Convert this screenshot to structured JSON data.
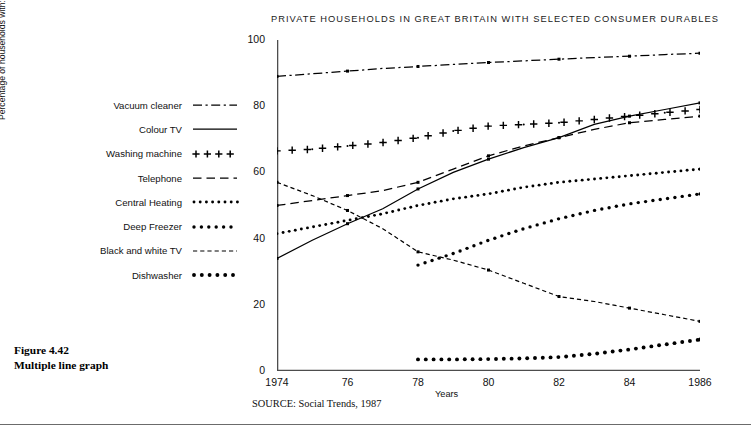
{
  "figure": {
    "caption_line1": "Figure 4.42",
    "caption_line2": "Multiple line graph",
    "source": "SOURCE: Social Trends, 1987"
  },
  "legend": {
    "items": [
      {
        "label": "Vacuum cleaner",
        "style": "dash-dot"
      },
      {
        "label": "Colour TV",
        "style": "solid"
      },
      {
        "label": "Washing machine",
        "style": "plus-markers"
      },
      {
        "label": "Telephone",
        "style": "long-dash"
      },
      {
        "label": "Central Heating",
        "style": "fine-dots"
      },
      {
        "label": "Deep Freezer",
        "style": "medium-dots"
      },
      {
        "label": "Black and white TV",
        "style": "short-dash"
      },
      {
        "label": "Dishwasher",
        "style": "bold-dots"
      }
    ]
  },
  "chart_data": {
    "type": "line",
    "title": "PRIVATE HOUSEHOLDS IN GREAT BRITAIN WITH SELECTED CONSUMER DURABLES",
    "xlabel": "Years",
    "ylabel": "Percentage of households with:",
    "xlim": [
      1974,
      1986
    ],
    "ylim": [
      0,
      100
    ],
    "grid": false,
    "legend_position": "left-outside",
    "xticks": [
      1974,
      1976,
      1978,
      1980,
      1982,
      1984,
      1986
    ],
    "xtick_labels": [
      "1974",
      "76",
      "78",
      "80",
      "82",
      "84",
      "1986"
    ],
    "yticks": [
      0,
      20,
      40,
      60,
      80,
      100
    ],
    "ytick_labels": [
      "0",
      "20",
      "40",
      "60",
      "80",
      "100"
    ],
    "series": [
      {
        "name": "Vacuum cleaner",
        "style": "dash-dot",
        "x": [
          1974,
          1975,
          1976,
          1977,
          1978,
          1979,
          1980,
          1981,
          1982,
          1983,
          1984,
          1985,
          1986
        ],
        "values": [
          89.0,
          89.8,
          90.6,
          91.4,
          92.0,
          92.6,
          93.2,
          93.7,
          94.2,
          94.7,
          95.1,
          95.6,
          96.0
        ]
      },
      {
        "name": "Colour TV",
        "style": "solid",
        "x": [
          1974,
          1975,
          1976,
          1977,
          1978,
          1979,
          1980,
          1981,
          1982,
          1983,
          1984,
          1985,
          1986
        ],
        "values": [
          34.0,
          39.5,
          44.5,
          49.0,
          55.0,
          60.0,
          64.0,
          67.5,
          70.5,
          74.5,
          77.0,
          79.0,
          81.0
        ]
      },
      {
        "name": "Washing machine",
        "style": "plus-markers",
        "x": [
          1974,
          1975,
          1976,
          1977,
          1978,
          1979,
          1980,
          1981,
          1982,
          1983,
          1984,
          1985,
          1986
        ],
        "values": [
          66.5,
          67.0,
          68.0,
          69.0,
          70.5,
          72.5,
          74.0,
          74.5,
          75.0,
          76.0,
          77.0,
          78.0,
          79.0
        ]
      },
      {
        "name": "Telephone",
        "style": "long-dash",
        "x": [
          1974,
          1975,
          1976,
          1977,
          1978,
          1979,
          1980,
          1981,
          1982,
          1983,
          1984,
          1985,
          1986
        ],
        "values": [
          50.0,
          51.5,
          53.0,
          54.5,
          57.0,
          61.0,
          65.0,
          68.0,
          70.5,
          73.0,
          75.0,
          76.0,
          77.0
        ]
      },
      {
        "name": "Central Heating",
        "style": "fine-dots",
        "x": [
          1974,
          1975,
          1976,
          1977,
          1978,
          1979,
          1980,
          1981,
          1982,
          1983,
          1984,
          1985,
          1986
        ],
        "values": [
          41.5,
          43.5,
          45.5,
          47.5,
          50.0,
          52.0,
          53.5,
          55.5,
          57.0,
          58.0,
          59.0,
          60.0,
          61.0
        ]
      },
      {
        "name": "Deep Freezer",
        "style": "medium-dots",
        "x": [
          1978,
          1979,
          1980,
          1981,
          1982,
          1983,
          1984,
          1985,
          1986
        ],
        "values": [
          32.0,
          35.5,
          39.5,
          43.0,
          46.0,
          48.5,
          50.5,
          52.0,
          53.5
        ]
      },
      {
        "name": "Black and white TV",
        "style": "short-dash",
        "x": [
          1974,
          1975,
          1976,
          1977,
          1978,
          1979,
          1980,
          1981,
          1982,
          1983,
          1984,
          1985,
          1986
        ],
        "values": [
          57.0,
          53.0,
          48.5,
          43.0,
          36.0,
          33.5,
          30.5,
          26.5,
          22.5,
          21.0,
          19.0,
          17.0,
          15.0
        ]
      },
      {
        "name": "Dishwasher",
        "style": "bold-dots",
        "x": [
          1978,
          1979,
          1980,
          1981,
          1982,
          1983,
          1984,
          1985,
          1986
        ],
        "values": [
          3.5,
          3.5,
          3.6,
          3.8,
          4.2,
          5.2,
          6.5,
          8.0,
          9.5
        ]
      }
    ]
  }
}
